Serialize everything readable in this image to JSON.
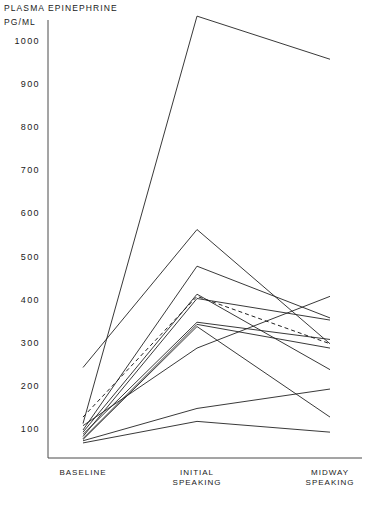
{
  "chart_data": {
    "type": "line",
    "title": "PLASMA EPINEPHRINE",
    "ylabel": "PG/ML",
    "xlabel": "",
    "categories": [
      "BASELINE",
      "INITIAL\nSPEAKING",
      "MIDWAY\nSPEAKING"
    ],
    "x_tick_labels": [
      "BASELINE",
      "INITIAL SPEAKING",
      "MIDWAY SPEAKING"
    ],
    "y_tick_labels": [
      "1000",
      "900",
      "800",
      "700",
      "600",
      "500",
      "400",
      "300",
      "200",
      "100"
    ],
    "y_ticks": [
      1000,
      900,
      800,
      700,
      600,
      500,
      400,
      300,
      200,
      100
    ],
    "ylim": [
      0,
      1100
    ],
    "grid": false,
    "legend": false,
    "series": [
      {
        "name": "subject-1",
        "values": [
          115,
          1060,
          960
        ],
        "style": "solid"
      },
      {
        "name": "subject-2",
        "values": [
          245,
          565,
          300
        ],
        "style": "solid"
      },
      {
        "name": "subject-3",
        "values": [
          100,
          480,
          360
        ],
        "style": "solid"
      },
      {
        "name": "subject-4",
        "values": [
          95,
          415,
          240
        ],
        "style": "solid"
      },
      {
        "name": "subject-5",
        "values": [
          85,
          405,
          355
        ],
        "style": "solid"
      },
      {
        "name": "subject-6",
        "values": [
          90,
          350,
          310
        ],
        "style": "solid"
      },
      {
        "name": "subject-7",
        "values": [
          80,
          345,
          290
        ],
        "style": "solid"
      },
      {
        "name": "subject-8",
        "values": [
          78,
          340,
          130
        ],
        "style": "solid"
      },
      {
        "name": "subject-9",
        "values": [
          75,
          150,
          195
        ],
        "style": "solid"
      },
      {
        "name": "subject-10",
        "values": [
          70,
          120,
          95
        ],
        "style": "solid"
      },
      {
        "name": "subject-11",
        "values": [
          110,
          290,
          410
        ],
        "style": "solid"
      },
      {
        "name": "mean",
        "values": [
          130,
          410,
          300
        ],
        "style": "dashed"
      }
    ]
  },
  "colors": {
    "line": "#222222",
    "axis": "#4a4a4a",
    "text": "#1a1a1a",
    "background": "#ffffff"
  }
}
